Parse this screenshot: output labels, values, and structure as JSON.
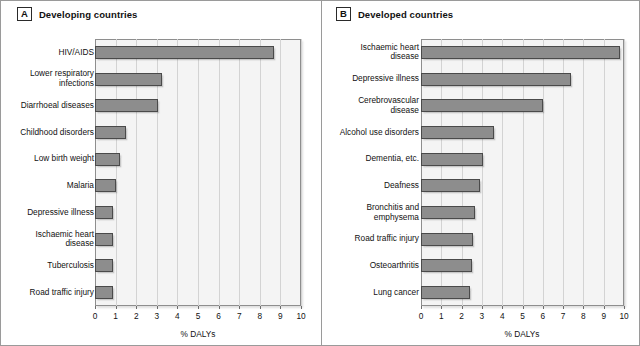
{
  "figure": {
    "panels": [
      {
        "letter": "A",
        "title": "Developing countries",
        "axis_title": "% DALYs"
      },
      {
        "letter": "B",
        "title": "Developed countries",
        "axis_title": "% DALYs"
      }
    ]
  },
  "chart_data": [
    {
      "type": "bar",
      "orientation": "horizontal",
      "panel": "A",
      "title": "Developing countries",
      "xlabel": "% DALYs",
      "ylabel": "",
      "xlim": [
        0,
        10
      ],
      "xticks": [
        0,
        1,
        2,
        3,
        4,
        5,
        6,
        7,
        8,
        9,
        10
      ],
      "grid": true,
      "legend": "none",
      "categories": [
        "HIV/AIDS",
        "Lower respiratory infections",
        "Diarrhoeal diseases",
        "Childhood disorders",
        "Low birth weight",
        "Malaria",
        "Depressive illness",
        "Ischaemic heart disease",
        "Tuberculosis",
        "Road traffic injury"
      ],
      "values": [
        8.7,
        3.25,
        3.05,
        1.5,
        1.2,
        1.0,
        0.85,
        0.85,
        0.85,
        0.85
      ]
    },
    {
      "type": "bar",
      "orientation": "horizontal",
      "panel": "B",
      "title": "Developed countries",
      "xlabel": "% DALYs",
      "ylabel": "",
      "xlim": [
        0,
        10
      ],
      "xticks": [
        0,
        1,
        2,
        3,
        4,
        5,
        6,
        7,
        8,
        9,
        10
      ],
      "grid": true,
      "legend": "none",
      "categories": [
        "Ischaemic heart disease",
        "Depressive illness",
        "Cerebrovascular disease",
        "Alcohol use disorders",
        "Dementia, etc.",
        "Deafness",
        "Bronchitis and emphysema",
        "Road traffic injury",
        "Osteoarthritis",
        "Lung cancer"
      ],
      "values": [
        9.8,
        7.4,
        6.0,
        3.6,
        3.05,
        2.9,
        2.65,
        2.55,
        2.5,
        2.4
      ]
    }
  ],
  "labels": {
    "panel_a": [
      "HIV/AIDS",
      "Lower respiratory\ninfections",
      "Diarrhoeal diseases",
      "Childhood disorders",
      "Low birth weight",
      "Malaria",
      "Depressive illness",
      "Ischaemic heart\ndisease",
      "Tuberculosis",
      "Road traffic injury"
    ],
    "panel_b": [
      "Ischaemic heart\ndisease",
      "Depressive illness",
      "Cerebrovascular\ndisease",
      "Alcohol use disorders",
      "Dementia, etc.",
      "Deafness",
      "Bronchitis and\nemphysema",
      "Road traffic injury",
      "Osteoarthritis",
      "Lung cancer"
    ]
  },
  "colors": {
    "bar_fill": "#8d8d8d",
    "bar_border": "#4a4a4a",
    "plot_bg": "#f4f4f4",
    "gridline": "#d3d3d3",
    "text": "#111111"
  }
}
